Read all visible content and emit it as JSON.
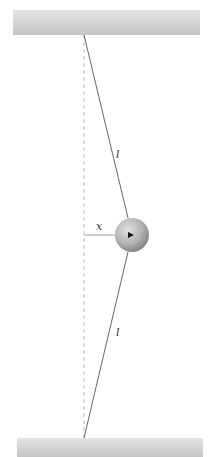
{
  "diagram": {
    "title": "",
    "labels": {
      "upper_string": "l",
      "lower_string": "l",
      "displacement": "x"
    },
    "elements": {
      "top_support": {
        "x": 13,
        "y": 10,
        "width": 187,
        "height": 25
      },
      "bottom_support": {
        "x": 17,
        "y": 438,
        "width": 186,
        "height": 19
      },
      "top_anchor": {
        "x": 84,
        "y": 35
      },
      "bottom_anchor": {
        "x": 84,
        "y": 438
      },
      "mass": {
        "cx": 132,
        "cy": 235,
        "r": 17
      },
      "equilibrium_line": "dashed vertical"
    },
    "colors": {
      "support": "#cfcfcf",
      "string": "#555555",
      "dashed": "#aaaaaa",
      "mass_light": "#dcdcdc",
      "mass_dark": "#8a8a8a"
    }
  }
}
